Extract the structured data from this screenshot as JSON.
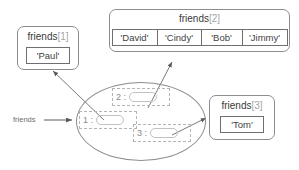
{
  "diagram": {
    "variable": {
      "name": "friends",
      "arrow_to": "dict-object"
    },
    "dict_object": {
      "name": "dict-object-ellipse",
      "slots": [
        {
          "key": "1 :",
          "value_ref": "friends[1]"
        },
        {
          "key": "2 :",
          "value_ref": "friends[2]"
        },
        {
          "key": "3 :",
          "value_ref": "friends[3]"
        }
      ]
    },
    "lists": [
      {
        "id": "friends-1",
        "name": "friends",
        "index": "[1]",
        "items": [
          "'Paul'"
        ]
      },
      {
        "id": "friends-2",
        "name": "friends",
        "index": "[2]",
        "items": [
          "'David'",
          "'Cindy'",
          "'Bob'",
          "'Jimmy'"
        ]
      },
      {
        "id": "friends-3",
        "name": "friends",
        "index": "[3]",
        "items": [
          "'Tom'"
        ]
      }
    ]
  },
  "colors": {
    "outline": "#8d8d8d",
    "cell_border": "#6f6f6f",
    "dashed": "#b4b4b4",
    "text": "#3a3a3a",
    "index_text": "#a6a6a6",
    "arrow": "#5a5a5a"
  }
}
